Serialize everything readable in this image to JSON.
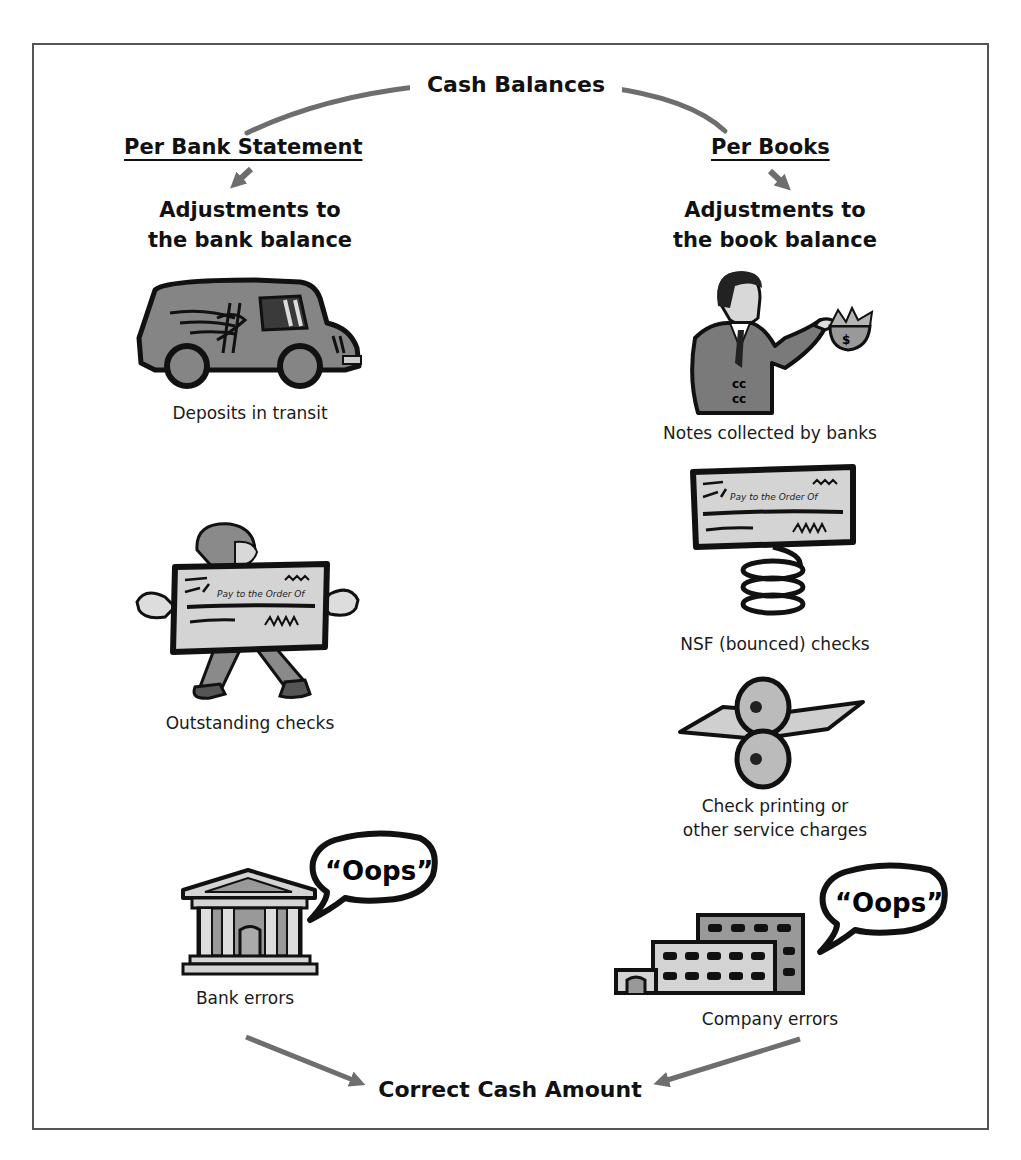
{
  "diagram": {
    "title": "Cash Balances",
    "colors": {
      "arrow": "#6e6e6e",
      "frame": "#555555",
      "illustration_fill": "#8a8a8a",
      "illustration_light": "#cfcfcf",
      "outline": "#111111"
    },
    "left_branch": {
      "heading": "Per Bank Statement",
      "subheading_line1": "Adjustments to",
      "subheading_line2": "the bank balance",
      "items": [
        {
          "label": "Deposits in transit",
          "icon": "armored-truck-icon"
        },
        {
          "label": "Outstanding checks",
          "icon": "person-holding-check-icon",
          "check_text": "Pay to the Order Of"
        },
        {
          "label": "Bank errors",
          "icon": "bank-building-icon",
          "speech": "“Oops”"
        }
      ]
    },
    "right_branch": {
      "heading": "Per Books",
      "subheading_line1": "Adjustments to",
      "subheading_line2": "the book balance",
      "items": [
        {
          "label": "Notes collected by banks",
          "icon": "businessman-with-money-bag-icon"
        },
        {
          "label": "NSF (bounced) checks",
          "icon": "check-on-spring-icon",
          "check_text": "Pay to the Order Of"
        },
        {
          "label_line1": "Check printing or",
          "label_line2": "other service charges",
          "icon": "printing-rollers-icon"
        },
        {
          "label": "Company errors",
          "icon": "office-building-icon",
          "speech": "“Oops”"
        }
      ]
    },
    "result": "Correct Cash Amount"
  }
}
